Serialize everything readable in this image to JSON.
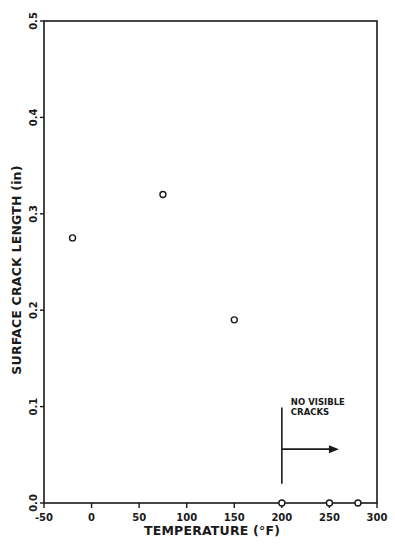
{
  "chart_data": {
    "type": "scatter",
    "title": "",
    "xlabel": "TEMPERATURE (°F)",
    "ylabel": "SURFACE CRACK LENGTH (in)",
    "xlim": [
      -50,
      300
    ],
    "ylim": [
      0.0,
      0.5
    ],
    "xticks": [
      -50,
      0,
      50,
      100,
      150,
      200,
      250,
      300
    ],
    "xtick_labels": [
      "-50",
      "0",
      "50",
      "100",
      "150",
      "200",
      "250",
      "300"
    ],
    "yticks": [
      0.0,
      0.1,
      0.2,
      0.3,
      0.4,
      0.5
    ],
    "ytick_labels": [
      "0.0",
      "0.1",
      "0.2",
      "0.3",
      "0.4",
      "0.5"
    ],
    "grid": false,
    "legend": null,
    "series": [
      {
        "name": "Surface crack length",
        "marker": "open-circle",
        "x": [
          -20,
          75,
          150,
          200,
          250,
          280
        ],
        "y": [
          0.275,
          0.32,
          0.19,
          0.0,
          0.0,
          0.0
        ]
      }
    ],
    "annotations": [
      {
        "text_lines": [
          "NO VISIBLE",
          "CRACKS"
        ],
        "type": "vertical-line-with-right-arrow",
        "x": 200,
        "y_range": [
          0.02,
          0.1
        ],
        "arrow_y": 0.06,
        "arrow_to_x": 260
      }
    ]
  },
  "colors": {
    "ink": "#1a1a1a",
    "background": "#ffffff"
  }
}
